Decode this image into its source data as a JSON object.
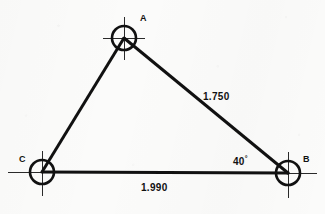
{
  "drawing": {
    "type": "engineering-triangle-survey-diagram",
    "background_color": "#fbfbfa",
    "line_color": "#111111",
    "vertices": [
      {
        "id": "A",
        "label": "A",
        "cx": 124,
        "cy": 38,
        "r": 12,
        "label_x": 140,
        "label_y": 14
      },
      {
        "id": "B",
        "label": "B",
        "cx": 288,
        "cy": 173,
        "r": 12,
        "label_x": 303,
        "label_y": 155
      },
      {
        "id": "C",
        "label": "C",
        "cx": 42,
        "cy": 172,
        "r": 12,
        "label_x": 19,
        "label_y": 155
      }
    ],
    "edges": [
      {
        "id": "edge-CA",
        "from": "C",
        "to": "A",
        "dimension": null
      },
      {
        "id": "edge-AB",
        "from": "A",
        "to": "B",
        "dimension": "1.750"
      },
      {
        "id": "edge-CB",
        "from": "C",
        "to": "B",
        "dimension": "1.990"
      }
    ],
    "dimensions": [
      {
        "id": "dim-AB",
        "value": "1.750",
        "x": 203,
        "y": 92
      },
      {
        "id": "dim-CB",
        "value": "1.990",
        "x": 141,
        "y": 183
      }
    ],
    "angles": [
      {
        "id": "angle-B",
        "value": "40",
        "unit": "°",
        "at_vertex": "B",
        "x": 233,
        "y": 155
      }
    ]
  }
}
